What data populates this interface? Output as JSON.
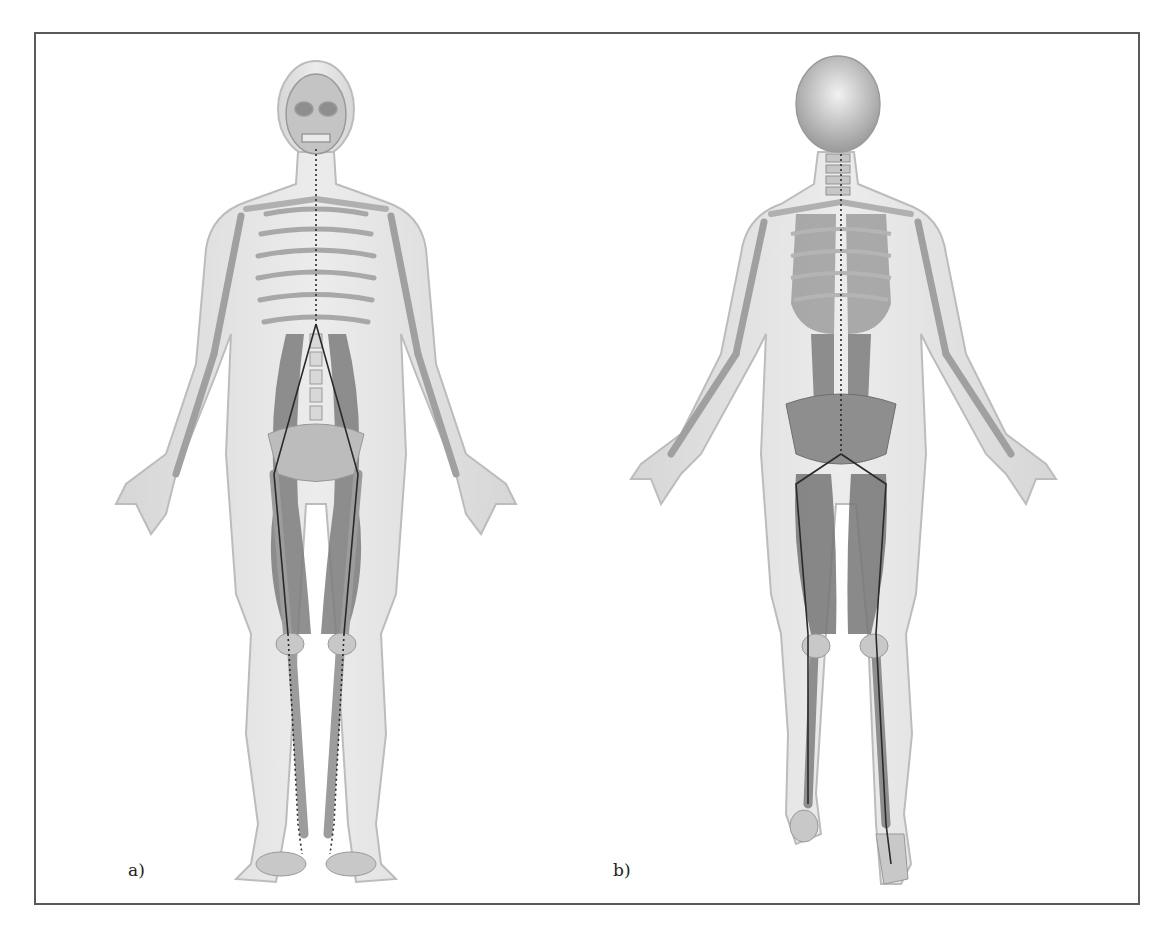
{
  "figure": {
    "panels": [
      {
        "id": "a",
        "label": "a)",
        "view": "anterior",
        "description": "Front view of human figure with translucent body outline, skeleton and deep muscles, meridian line from chin down trunk and legs to feet"
      },
      {
        "id": "b",
        "label": "b)",
        "view": "posterior",
        "description": "Back view of human figure with translucent body outline, skeleton and back/leg muscles, meridian line along spine and back of legs to feet"
      }
    ],
    "colors": {
      "frame": "#5a5a5a",
      "silhouette": "#d9d9d9",
      "bone": "#bdbdbd",
      "muscle": "#7a7a7a",
      "meridian": "#2a2a2a"
    }
  }
}
